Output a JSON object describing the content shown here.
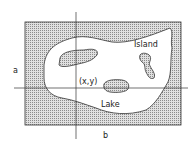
{
  "diagram": {
    "labels": {
      "island": "Island",
      "point": "(x,y)",
      "lake": "Lake",
      "axis_a": "a",
      "axis_b": "b"
    },
    "colors": {
      "land_fill": "#bdbdbd",
      "water_fill": "#ffffff",
      "stroke": "#333333"
    }
  }
}
